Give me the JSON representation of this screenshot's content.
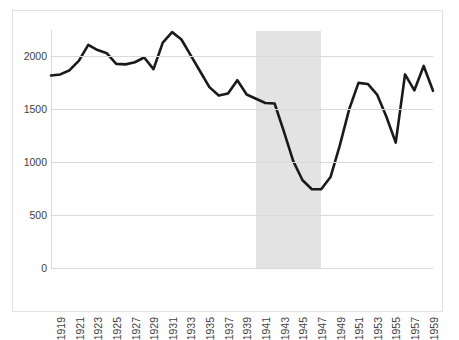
{
  "chart_data": {
    "type": "line",
    "title": "",
    "subtitle": "",
    "xlabel": "",
    "ylabel": "",
    "xlim": [
      1919,
      1960
    ],
    "ylim": [
      0,
      2250
    ],
    "y_ticks": [
      0,
      500,
      1000,
      1500,
      2000
    ],
    "y_tick_labels": [
      "0",
      "500",
      "1000",
      "1500",
      "2000"
    ],
    "x_tick_labels": [
      "1919",
      "1921",
      "1923",
      "1925",
      "1927",
      "1929",
      "1931",
      "1933",
      "1935",
      "1937",
      "1939",
      "1941",
      "1943",
      "1945",
      "1947",
      "1949",
      "1951",
      "1953",
      "1955",
      "1957",
      "1959"
    ],
    "grid": "horizontal",
    "legend": "none",
    "x": [
      1919,
      1920,
      1921,
      1922,
      1923,
      1924,
      1925,
      1926,
      1927,
      1928,
      1929,
      1930,
      1931,
      1932,
      1933,
      1934,
      1935,
      1936,
      1937,
      1938,
      1939,
      1940,
      1941,
      1942,
      1943,
      1944,
      1945,
      1946,
      1947,
      1948,
      1949,
      1950,
      1951,
      1952,
      1953,
      1954,
      1955,
      1956,
      1957,
      1958,
      1959,
      1960
    ],
    "series": [
      {
        "name": "series-1",
        "color": "#1a1a1a",
        "line_width": 2.6,
        "values": [
          1820,
          1830,
          1870,
          1960,
          2110,
          2060,
          2030,
          1930,
          1925,
          1945,
          1990,
          1880,
          2130,
          2230,
          2160,
          2010,
          1860,
          1710,
          1630,
          1650,
          1775,
          1640,
          1600,
          1560,
          1555,
          1290,
          1010,
          830,
          745,
          745,
          860,
          1160,
          1500,
          1750,
          1740,
          1640,
          1430,
          1185,
          1830,
          1680,
          1910,
          1675
        ]
      }
    ],
    "shaded_bands": [
      {
        "name": "war-years-band",
        "color": "#e3e3e3",
        "x_start": 1941,
        "x_end": 1948
      }
    ],
    "plot_background": "#ffffff",
    "grid_color": "#d9d9d9",
    "border_color": "#e2e2e2"
  }
}
